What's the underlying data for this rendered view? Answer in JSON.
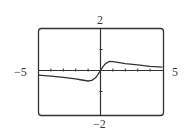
{
  "chart_data": {
    "type": "line",
    "title": "",
    "xlabel": "",
    "ylabel": "",
    "xlim": [
      -5,
      5
    ],
    "ylim": [
      -2,
      2
    ],
    "grid": false,
    "legend": null,
    "tick_labels": {
      "x_min": "−5",
      "x_max": "5",
      "y_max": "2",
      "y_min": "−2"
    },
    "x_ticks": [
      -4,
      -3,
      -2,
      -1,
      1,
      2,
      3,
      4
    ],
    "y_ticks": [
      -1,
      1
    ],
    "series": [
      {
        "name": "f(x)",
        "x": [
          -5,
          -4,
          -3,
          -2,
          -1.5,
          -1,
          -0.7,
          -0.4,
          -0.2,
          0,
          0.2,
          0.4,
          0.7,
          1,
          1.5,
          2,
          3,
          4,
          5
        ],
        "y": [
          -0.22,
          -0.27,
          -0.33,
          -0.4,
          -0.45,
          -0.5,
          -0.47,
          -0.35,
          -0.18,
          0,
          0.18,
          0.33,
          0.43,
          0.42,
          0.37,
          0.33,
          0.27,
          0.2,
          0.16
        ]
      }
    ]
  },
  "colors": {
    "frame": "#333333",
    "axes": "#333333",
    "curve": "#333333",
    "background": "#ffffff"
  }
}
